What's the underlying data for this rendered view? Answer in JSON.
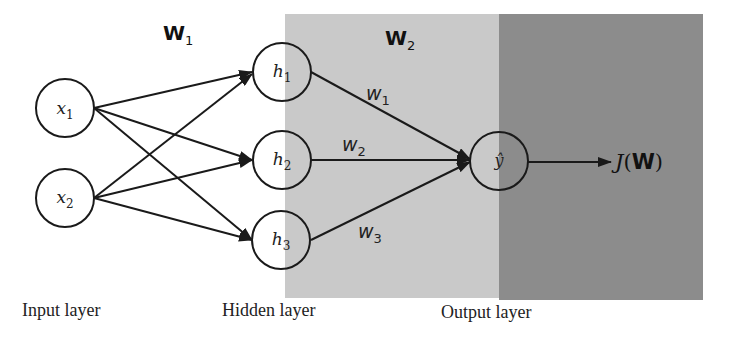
{
  "colors": {
    "background": "#ffffff",
    "hidden_output_region": "#c9c9c9",
    "output_cost_region": "#8c8c8c",
    "stroke": "#1a1a1a",
    "text": "#222222"
  },
  "weight_matrices": {
    "w1_main": "W",
    "w1_sub": "1",
    "w2_main": "W",
    "w2_sub": "2"
  },
  "nodes": {
    "input": [
      {
        "main": "x",
        "sub": "1"
      },
      {
        "main": "x",
        "sub": "2"
      }
    ],
    "hidden": [
      {
        "main": "h",
        "sub": "1"
      },
      {
        "main": "h",
        "sub": "2"
      },
      {
        "main": "h",
        "sub": "3"
      }
    ],
    "output": {
      "main": "ŷ"
    }
  },
  "edge_weights": [
    {
      "main": "w",
      "sub": "1"
    },
    {
      "main": "w",
      "sub": "2"
    },
    {
      "main": "w",
      "sub": "3"
    }
  ],
  "cost": {
    "func": "J",
    "open": "(",
    "arg": "W",
    "close": ")"
  },
  "layers": {
    "input": "Input layer",
    "hidden": "Hidden layer",
    "output": "Output layer"
  }
}
